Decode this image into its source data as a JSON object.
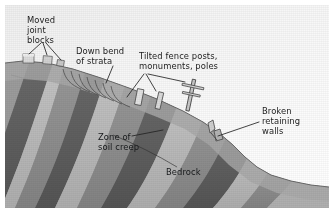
{
  "figure": {
    "type": "geologic-cross-section-block-diagram",
    "frame": {
      "width": 334,
      "height": 218,
      "background": "#ffffff"
    }
  },
  "labels": {
    "moved_joint_blocks": "Moved\njoint\nblocks",
    "down_bend_of_strata": "Down bend\nof strata",
    "tilted_fence_posts": "Tilted fence posts,\nmonuments, poles",
    "broken_retaining_walls": "Broken\nretaining\nwalls",
    "zone_of_soil_creep": "Zone of\nsoil creep",
    "bedrock": "Bedrock"
  },
  "colors": {
    "sky": "#f4f4f4",
    "stratum_dark": "#5b5b5b",
    "stratum_mid": "#8e8e8e",
    "stratum_light": "#c2c2c2",
    "soil_creep_zone": "#9a9a9a",
    "leader_line": "#2a2a2a",
    "text": "#1c1c1c"
  },
  "features": {
    "strata_count": 9,
    "joint_blocks": 3,
    "fence_posts": 2,
    "utility_poles": 1,
    "retaining_walls": 1,
    "slope_direction": "right-descending"
  }
}
